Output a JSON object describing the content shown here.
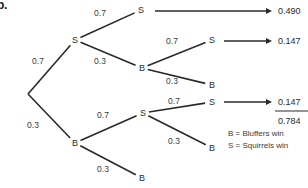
{
  "figure": {
    "label": "b.",
    "background_color": "#ffffff",
    "line_color": "#2a2a2a",
    "text_color": "#2b2b2b"
  },
  "tree": {
    "root": {
      "id": "root",
      "label": "",
      "x": 28,
      "y": 94
    },
    "nodes": [
      {
        "id": "n-s1",
        "label": "S",
        "x": 75,
        "y": 40,
        "level": 1
      },
      {
        "id": "n-b1",
        "label": "B",
        "x": 75,
        "y": 143,
        "level": 1
      },
      {
        "id": "n-s1-s2",
        "label": "S",
        "x": 141,
        "y": 10,
        "level": 2
      },
      {
        "id": "n-s1-b2",
        "label": "B",
        "x": 142,
        "y": 68,
        "level": 2
      },
      {
        "id": "n-b1-s2",
        "label": "S",
        "x": 143,
        "y": 113,
        "level": 2
      },
      {
        "id": "n-b1-b2",
        "label": "B",
        "x": 142,
        "y": 178,
        "level": 2
      },
      {
        "id": "n-s1-b2-s3",
        "label": "S",
        "x": 212,
        "y": 40,
        "level": 3
      },
      {
        "id": "n-s1-b2-b3",
        "label": "B",
        "x": 212,
        "y": 85,
        "level": 3
      },
      {
        "id": "n-b1-s2-s3",
        "label": "S",
        "x": 212,
        "y": 102,
        "level": 3
      },
      {
        "id": "n-b1-s2-b3",
        "label": "B",
        "x": 212,
        "y": 148,
        "level": 3
      }
    ],
    "branches": [
      {
        "id": "br-root-s1",
        "from": "root",
        "to": "n-s1",
        "probability": "0.7",
        "lx": 38,
        "ly": 64
      },
      {
        "id": "br-root-b1",
        "from": "root",
        "to": "n-b1",
        "probability": "0.3",
        "lx": 33,
        "ly": 128
      },
      {
        "id": "br-s1-s2",
        "from": "n-s1",
        "to": "n-s1-s2",
        "probability": "0.7",
        "lx": 100,
        "ly": 16
      },
      {
        "id": "br-s1-b2",
        "from": "n-s1",
        "to": "n-s1-b2",
        "probability": "0.3",
        "lx": 100,
        "ly": 64
      },
      {
        "id": "br-b1-s2",
        "from": "n-b1",
        "to": "n-b1-s2",
        "probability": "0.7",
        "lx": 103,
        "ly": 118
      },
      {
        "id": "br-b1-b2",
        "from": "n-b1",
        "to": "n-b1-b2",
        "probability": "0.3",
        "lx": 103,
        "ly": 172
      },
      {
        "id": "br-b2-s3",
        "from": "n-s1-b2",
        "to": "n-s1-b2-s3",
        "probability": "0.7",
        "lx": 172,
        "ly": 44
      },
      {
        "id": "br-b2-b3",
        "from": "n-s1-b2",
        "to": "n-s1-b2-b3",
        "probability": "0.3",
        "lx": 172,
        "ly": 84
      },
      {
        "id": "br-s2-s3",
        "from": "n-b1-s2",
        "to": "n-b1-s2-s3",
        "probability": "0.7",
        "lx": 174,
        "ly": 104
      },
      {
        "id": "br-s2-b3",
        "from": "n-b1-s2",
        "to": "n-b1-s2-b3",
        "probability": "0.3",
        "lx": 174,
        "ly": 144
      }
    ]
  },
  "outcomes": [
    {
      "id": "out-1",
      "value": "0.490",
      "from_node": "n-s1-s2",
      "arrow_x1": 155,
      "arrow_x2": 272,
      "y": 11
    },
    {
      "id": "out-2",
      "value": "0.147",
      "from_node": "n-s1-b2-s3",
      "arrow_x1": 224,
      "arrow_x2": 272,
      "y": 41
    },
    {
      "id": "out-3",
      "value": "0.147",
      "from_node": "n-b1-s2-s3",
      "arrow_x1": 224,
      "arrow_x2": 272,
      "y": 102
    }
  ],
  "total": {
    "id": "grand-total",
    "value": "0.784",
    "rule_x1": 275,
    "rule_x2": 308,
    "rule_y": 111,
    "y": 121
  },
  "legend": {
    "items": [
      {
        "id": "legend-b",
        "text": "B = Bluffers win",
        "x": 228,
        "y": 136
      },
      {
        "id": "legend-s",
        "text": "S = Squirrels win",
        "x": 228,
        "y": 148
      }
    ]
  }
}
